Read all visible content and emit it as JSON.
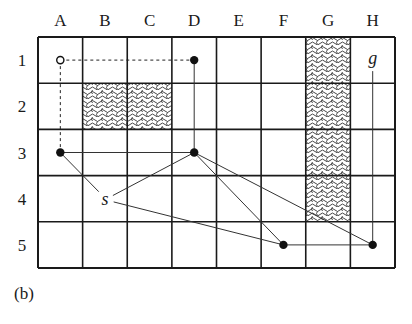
{
  "diagram": {
    "columns": [
      "A",
      "B",
      "C",
      "D",
      "E",
      "F",
      "G",
      "H"
    ],
    "rows": [
      "1",
      "2",
      "3",
      "4",
      "5"
    ],
    "obstacles": [
      {
        "col": "B",
        "row": "2"
      },
      {
        "col": "C",
        "row": "2"
      },
      {
        "col": "G",
        "row": "1"
      },
      {
        "col": "G",
        "row": "2"
      },
      {
        "col": "G",
        "row": "3"
      },
      {
        "col": "G",
        "row": "4"
      }
    ],
    "nodes": [
      {
        "id": "A1",
        "type": "open"
      },
      {
        "id": "D1",
        "type": "filled"
      },
      {
        "id": "A3",
        "type": "filled"
      },
      {
        "id": "D3",
        "type": "filled"
      },
      {
        "id": "F5",
        "type": "filled"
      },
      {
        "id": "H5",
        "type": "filled"
      }
    ],
    "labels": {
      "start": "s",
      "goal": "g"
    },
    "edges_dashed": [
      [
        "A1",
        "D1"
      ],
      [
        "A1",
        "A3"
      ]
    ],
    "edges_solid": [
      [
        "D1",
        "D3"
      ],
      [
        "A3",
        "D3"
      ],
      [
        "A3",
        "s"
      ],
      [
        "s",
        "D3"
      ],
      [
        "s",
        "F5"
      ],
      [
        "D3",
        "F5"
      ],
      [
        "D3",
        "H5"
      ],
      [
        "F5",
        "H5"
      ],
      [
        "H5",
        "g"
      ]
    ]
  },
  "caption": "(b)"
}
